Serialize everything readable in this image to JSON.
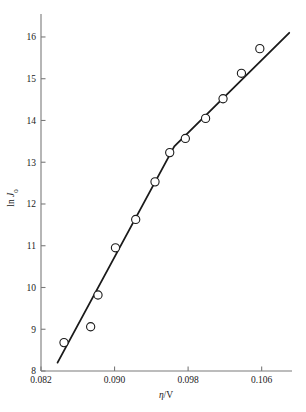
{
  "chart_data": {
    "type": "scatter",
    "title": "",
    "subtitle": "",
    "xlabel": "η/V",
    "ylabel": "ln J₀",
    "xlabel_parts": {
      "symbol": "η",
      "unit": "/V"
    },
    "ylabel_parts": {
      "prefix": "ln ",
      "symbol": "J",
      "subscript": "0"
    },
    "xlim": [
      0.082,
      0.1093
    ],
    "ylim": [
      8,
      16.55
    ],
    "xticks": [
      0.082,
      0.09,
      0.098,
      0.106
    ],
    "xtick_labels": [
      "0.082",
      "0.090",
      "0.098",
      "0.106"
    ],
    "yticks": [
      8,
      9,
      10,
      11,
      12,
      13,
      14,
      15,
      16
    ],
    "ytick_labels": [
      "8",
      "9",
      "10",
      "11",
      "12",
      "13",
      "14",
      "15",
      "16"
    ],
    "grid": false,
    "legend": "none",
    "marker": "open-circle",
    "marker_color": "#1a1a1a",
    "line_color": "#1a1a1a",
    "axis_color": "#7a7a7a",
    "x": [
      0.0845,
      0.0874,
      0.0882,
      0.0901,
      0.0923,
      0.0944,
      0.096,
      0.0977,
      0.0999,
      0.1018,
      0.1038,
      0.1058
    ],
    "y": [
      8.68,
      9.06,
      9.82,
      10.95,
      11.63,
      12.53,
      13.23,
      13.57,
      14.05,
      14.52,
      15.13,
      15.72
    ],
    "points": [
      {
        "x": 0.0845,
        "y": 8.68
      },
      {
        "x": 0.0874,
        "y": 9.06
      },
      {
        "x": 0.0882,
        "y": 9.82
      },
      {
        "x": 0.0901,
        "y": 10.95
      },
      {
        "x": 0.0923,
        "y": 11.63
      },
      {
        "x": 0.0944,
        "y": 12.53
      },
      {
        "x": 0.096,
        "y": 13.23
      },
      {
        "x": 0.0977,
        "y": 13.57
      },
      {
        "x": 0.0999,
        "y": 14.05
      },
      {
        "x": 0.1018,
        "y": 14.52
      },
      {
        "x": 0.1038,
        "y": 15.13
      },
      {
        "x": 0.1058,
        "y": 15.72
      }
    ],
    "fit_line": {
      "description": "two-segment fitted line with break near η = 0.0965 V",
      "vertices": [
        {
          "x": 0.0838,
          "y": 8.2
        },
        {
          "x": 0.0965,
          "y": 13.38
        },
        {
          "x": 0.109,
          "y": 16.1
        }
      ]
    }
  }
}
